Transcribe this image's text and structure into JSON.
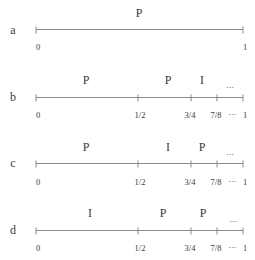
{
  "diagram": {
    "rows": [
      {
        "label": "a",
        "segments": [
          "P"
        ],
        "tick_labels": [
          "0",
          "1"
        ]
      },
      {
        "label": "b",
        "segments": [
          "P",
          "P",
          "I",
          "···"
        ],
        "tick_labels": [
          "0",
          "1/2",
          "3/4",
          "7/8",
          "···",
          "1"
        ]
      },
      {
        "label": "c",
        "segments": [
          "P",
          "I",
          "P",
          "···"
        ],
        "tick_labels": [
          "0",
          "1/2",
          "3/4",
          "7/8",
          "···",
          "1"
        ]
      },
      {
        "label": "d",
        "segments": [
          "I",
          "P",
          "P",
          "···"
        ],
        "tick_labels": [
          "0",
          "1/2",
          "3/4",
          "7/8",
          "···",
          "1"
        ]
      }
    ],
    "colors": {
      "line": "#8a8a8a",
      "text": "#3a3a3a"
    }
  }
}
